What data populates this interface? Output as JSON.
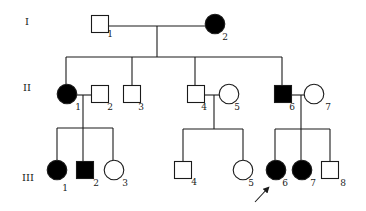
{
  "pedigree": {
    "colors": {
      "affected": "#000000",
      "unaffected": "#ffffff",
      "line": "#1a1a1a"
    },
    "generations": [
      {
        "label": "I",
        "x": 27,
        "y": 25
      },
      {
        "label": "II",
        "x": 27,
        "y": 91
      },
      {
        "label": "III",
        "x": 28,
        "y": 181
      }
    ],
    "individuals": [
      {
        "id": "I-1",
        "label": "1",
        "sex": "male",
        "affected": false,
        "cx": 100,
        "cy": 24,
        "lx": 110,
        "ly": 37
      },
      {
        "id": "I-2",
        "label": "2",
        "sex": "female",
        "affected": true,
        "cx": 215,
        "cy": 24,
        "lx": 225,
        "ly": 40
      },
      {
        "id": "II-1",
        "label": "1",
        "sex": "female",
        "affected": true,
        "cx": 67,
        "cy": 94,
        "lx": 78,
        "ly": 110
      },
      {
        "id": "II-2",
        "label": "2",
        "sex": "male",
        "affected": false,
        "cx": 100,
        "cy": 94,
        "lx": 110,
        "ly": 110
      },
      {
        "id": "II-3",
        "label": "3",
        "sex": "male",
        "affected": false,
        "cx": 132,
        "cy": 94,
        "lx": 141,
        "ly": 110
      },
      {
        "id": "II-4",
        "label": "4",
        "sex": "male",
        "affected": false,
        "cx": 196,
        "cy": 94,
        "lx": 204,
        "ly": 110
      },
      {
        "id": "II-5",
        "label": "5",
        "sex": "female",
        "affected": false,
        "cx": 229,
        "cy": 94,
        "lx": 237,
        "ly": 110
      },
      {
        "id": "II-6",
        "label": "6",
        "sex": "male",
        "affected": true,
        "cx": 283,
        "cy": 94,
        "lx": 292,
        "ly": 110
      },
      {
        "id": "II-7",
        "label": "7",
        "sex": "female",
        "affected": false,
        "cx": 314,
        "cy": 94,
        "lx": 328,
        "ly": 110
      },
      {
        "id": "III-1",
        "label": "1",
        "sex": "female",
        "affected": true,
        "cx": 57,
        "cy": 170,
        "lx": 65,
        "ly": 191
      },
      {
        "id": "III-2",
        "label": "2",
        "sex": "male",
        "affected": true,
        "cx": 85,
        "cy": 170,
        "lx": 96,
        "ly": 186
      },
      {
        "id": "III-3",
        "label": "3",
        "sex": "female",
        "affected": false,
        "cx": 114,
        "cy": 170,
        "lx": 125,
        "ly": 186
      },
      {
        "id": "III-4",
        "label": "4",
        "sex": "male",
        "affected": false,
        "cx": 183,
        "cy": 170,
        "lx": 194,
        "ly": 185
      },
      {
        "id": "III-5",
        "label": "5",
        "sex": "female",
        "affected": false,
        "cx": 243,
        "cy": 170,
        "lx": 251,
        "ly": 186
      },
      {
        "id": "III-6",
        "label": "6",
        "sex": "female",
        "affected": true,
        "cx": 276,
        "cy": 170,
        "lx": 285,
        "ly": 186
      },
      {
        "id": "III-7",
        "label": "7",
        "sex": "female",
        "affected": true,
        "cx": 302,
        "cy": 170,
        "lx": 313,
        "ly": 186
      },
      {
        "id": "III-8",
        "label": "8",
        "sex": "male",
        "affected": false,
        "cx": 330,
        "cy": 170,
        "lx": 343,
        "ly": 186
      }
    ],
    "lines": [
      [
        108,
        26,
        205,
        26
      ],
      [
        157,
        26,
        157,
        57
      ],
      [
        66,
        57,
        282,
        57
      ],
      [
        66,
        57,
        66,
        84
      ],
      [
        132,
        57,
        132,
        86
      ],
      [
        195,
        57,
        195,
        86
      ],
      [
        282,
        57,
        282,
        86
      ],
      [
        77,
        95,
        92,
        95
      ],
      [
        83,
        95,
        83,
        128
      ],
      [
        57,
        128,
        113,
        128
      ],
      [
        57,
        128,
        57,
        160
      ],
      [
        83,
        128,
        83,
        162
      ],
      [
        113,
        128,
        113,
        160
      ],
      [
        204,
        95,
        219,
        95
      ],
      [
        214,
        95,
        214,
        129
      ],
      [
        183,
        129,
        243,
        129
      ],
      [
        183,
        129,
        183,
        162
      ],
      [
        243,
        129,
        243,
        160
      ],
      [
        292,
        95,
        304,
        95
      ],
      [
        301,
        95,
        301,
        129
      ],
      [
        275,
        129,
        330,
        129
      ],
      [
        275,
        129,
        275,
        160
      ],
      [
        301,
        129,
        301,
        160
      ],
      [
        330,
        129,
        330,
        162
      ]
    ],
    "proband": {
      "id": "III-6",
      "arrow": [
        255,
        202,
        268,
        188
      ]
    }
  }
}
